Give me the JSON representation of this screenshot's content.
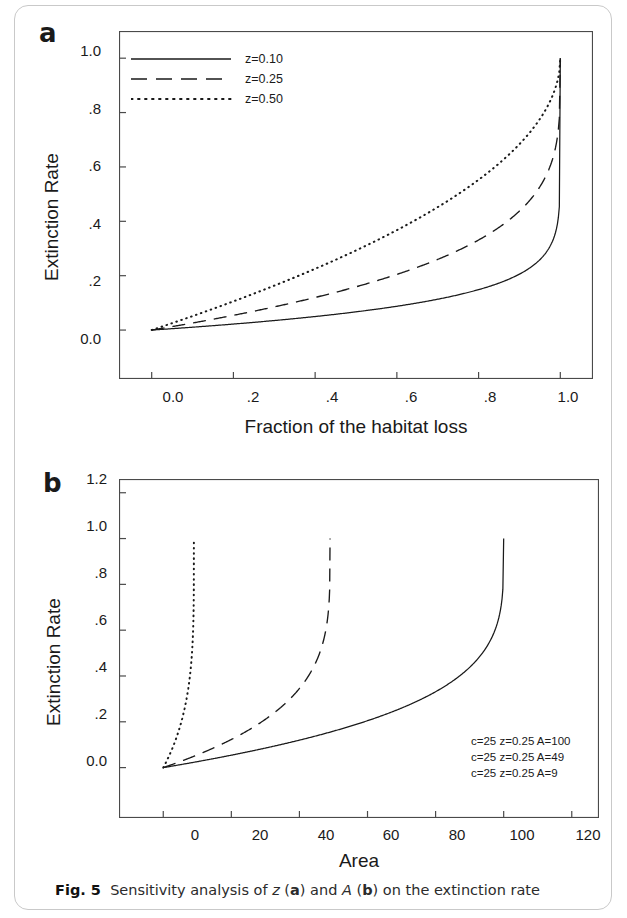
{
  "figure": {
    "caption_label": "Fig. 5",
    "caption_text_1": "Sensitivity analysis of ",
    "caption_var_1": "z",
    "caption_text_2": " (",
    "caption_bold_a": "a",
    "caption_text_3": ") and ",
    "caption_var_2": "A",
    "caption_text_4": " (",
    "caption_bold_b": "b",
    "caption_text_5": ") on the extinction rate",
    "border_color": "#c9c9c9",
    "line_color": "#1a1a1a"
  },
  "panel_a": {
    "letter": "a",
    "ylabel": "Extinction Rate",
    "xlabel": "Fraction of the habitat loss",
    "ytick_labels": [
      "1.0",
      ".8",
      ".6",
      ".4",
      ".2",
      "0.0"
    ],
    "xtick_labels": [
      "0.0",
      ".2",
      ".4",
      ".6",
      ".8",
      "1.0"
    ],
    "legend": [
      {
        "label": "z=0.10",
        "style": "solid"
      },
      {
        "label": "z=0.25",
        "style": "dashed"
      },
      {
        "label": "z=0.50",
        "style": "dotted"
      }
    ]
  },
  "panel_b": {
    "letter": "b",
    "ylabel": "Extinction Rate",
    "xlabel": "Area",
    "ytick_labels": [
      "1.2",
      "1.0",
      ".8",
      ".6",
      ".4",
      ".2",
      "0.0"
    ],
    "xtick_labels": [
      "0",
      "20",
      "40",
      "60",
      "80",
      "100",
      "120"
    ],
    "legend": [
      {
        "label": "c=25 z=0.25 A=100",
        "style": "solid"
      },
      {
        "label": "c=25 z=0.25 A=49",
        "style": "dashed"
      },
      {
        "label": "c=25 z=0.25 A=9",
        "style": "dotted"
      }
    ]
  },
  "chart_data": [
    {
      "type": "line",
      "panel": "a",
      "title": "",
      "xlabel": "Fraction of the habitat loss",
      "ylabel": "Extinction Rate",
      "xlim": [
        -0.08,
        1.08
      ],
      "ylim": [
        -0.18,
        1.1
      ],
      "xticks": [
        0.0,
        0.2,
        0.4,
        0.6,
        0.8,
        1.0
      ],
      "xtick_labels": [
        "0.0",
        ".2",
        ".4",
        ".6",
        ".8",
        "1.0"
      ],
      "yticks": [
        1.0,
        0.8,
        0.6,
        0.4,
        0.2,
        0.0
      ],
      "ytick_labels": [
        "1.0",
        ".8",
        ".6",
        ".4",
        ".2",
        "0.0"
      ],
      "grid": false,
      "legend_position": "top-left",
      "formula": "E = 1 - (1 - p)^z",
      "series": [
        {
          "name": "z=0.10",
          "style": "solid",
          "z": 0.1,
          "x": [
            0.0,
            0.1,
            0.2,
            0.3,
            0.4,
            0.5,
            0.6,
            0.7,
            0.8,
            0.9,
            0.95,
            0.98,
            0.99,
            1.0
          ],
          "values": [
            0.0,
            0.0105,
            0.0222,
            0.0354,
            0.0505,
            0.067,
            0.0876,
            0.1131,
            0.1472,
            0.2057,
            0.2589,
            0.3234,
            0.369,
            1.0
          ]
        },
        {
          "name": "z=0.25",
          "style": "dashed",
          "z": 0.25,
          "x": [
            0.0,
            0.1,
            0.2,
            0.3,
            0.4,
            0.5,
            0.6,
            0.7,
            0.8,
            0.9,
            0.95,
            0.98,
            0.99,
            1.0
          ],
          "values": [
            0.0,
            0.026,
            0.0559,
            0.0905,
            0.1309,
            0.1591,
            0.2032,
            0.2596,
            0.3313,
            0.4377,
            0.5267,
            0.6238,
            0.6838,
            1.0
          ]
        },
        {
          "name": "z=0.50",
          "style": "dotted",
          "z": 0.5,
          "x": [
            0.0,
            0.1,
            0.2,
            0.3,
            0.4,
            0.5,
            0.6,
            0.7,
            0.8,
            0.9,
            0.95,
            0.98,
            0.99,
            1.0
          ],
          "values": [
            0.0,
            0.0513,
            0.1056,
            0.1633,
            0.2254,
            0.2929,
            0.3675,
            0.4523,
            0.5528,
            0.6838,
            0.7764,
            0.8586,
            0.9,
            1.0
          ]
        }
      ]
    },
    {
      "type": "line",
      "panel": "b",
      "title": "",
      "xlabel": "Area",
      "ylabel": "Extinction Rate",
      "xlim": [
        -13,
        128
      ],
      "ylim": [
        -0.22,
        1.26
      ],
      "xticks": [
        0,
        20,
        40,
        60,
        80,
        100,
        120
      ],
      "xtick_labels": [
        "0",
        "20",
        "40",
        "60",
        "80",
        "100",
        "120"
      ],
      "yticks": [
        1.2,
        1.0,
        0.8,
        0.6,
        0.4,
        0.2,
        0.0
      ],
      "ytick_labels": [
        "1.2",
        "1.0",
        ".8",
        ".6",
        ".4",
        ".2",
        "0.0"
      ],
      "grid": false,
      "legend_position": "bottom-right",
      "formula": "E = 1 - (1 - a/A)^z",
      "series": [
        {
          "name": "c=25 z=0.25 A=100",
          "style": "solid",
          "c": 25,
          "z": 0.25,
          "A": 100,
          "x": [
            0,
            10,
            20,
            30,
            40,
            50,
            60,
            70,
            80,
            90,
            95,
            98,
            99,
            100
          ],
          "values": [
            0.0,
            0.026,
            0.0559,
            0.0905,
            0.1309,
            0.1591,
            0.2032,
            0.2596,
            0.3313,
            0.4377,
            0.5267,
            0.6238,
            0.6838,
            1.0
          ]
        },
        {
          "name": "c=25 z=0.25 A=49",
          "style": "dashed",
          "c": 25,
          "z": 0.25,
          "A": 49,
          "x": [
            0,
            5,
            10,
            15,
            20,
            25,
            30,
            35,
            40,
            44,
            46.5,
            48,
            48.5,
            49
          ],
          "values": [
            0.0,
            0.0263,
            0.0565,
            0.0915,
            0.1325,
            0.1813,
            0.24,
            0.312,
            0.4027,
            0.5,
            0.583,
            0.67,
            0.725,
            1.0
          ]
        },
        {
          "name": "c=25 z=0.25 A=9",
          "style": "dotted",
          "c": 25,
          "z": 0.25,
          "A": 9,
          "x": [
            0,
            1,
            2,
            3,
            4,
            5,
            6,
            7,
            8,
            8.5,
            8.8,
            8.95,
            9
          ],
          "values": [
            0.0,
            0.0288,
            0.0613,
            0.0984,
            0.1413,
            0.1918,
            0.2528,
            0.3302,
            0.4377,
            0.518,
            0.6,
            0.7,
            1.0
          ]
        }
      ]
    }
  ]
}
